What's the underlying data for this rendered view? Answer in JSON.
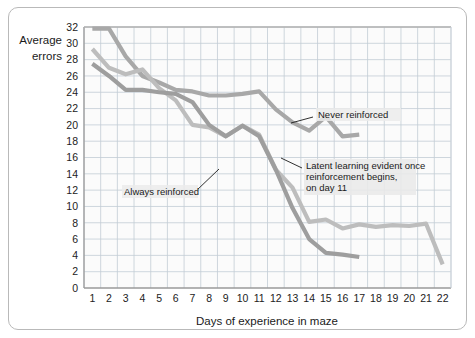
{
  "figure": {
    "border_color": "#b9b9b9",
    "background": "#ffffff"
  },
  "chart_data": {
    "type": "line",
    "title": "",
    "xlabel": "Days of experience in maze",
    "ylabel": "Average errors",
    "ylabel_line1": "Average",
    "ylabel_line2": "errors",
    "xlim": [
      1,
      22
    ],
    "ylim": [
      0,
      32
    ],
    "grid": true,
    "legend_position": "inline-annotations",
    "ytick_labels": [
      "0",
      "2",
      "4",
      "6",
      "8",
      "10",
      "12",
      "14",
      "16",
      "18",
      "20",
      "22",
      "24",
      "26",
      "28",
      "30",
      "32"
    ],
    "yticks": [
      0,
      2,
      4,
      6,
      8,
      10,
      12,
      14,
      16,
      18,
      20,
      22,
      24,
      26,
      28,
      30,
      32
    ],
    "xtick_labels": [
      "1",
      "2",
      "3",
      "4",
      "5",
      "6",
      "7",
      "8",
      "9",
      "10",
      "11",
      "12",
      "13",
      "14",
      "15",
      "16",
      "17",
      "18",
      "19",
      "20",
      "21",
      "22"
    ],
    "xticks": [
      1,
      2,
      3,
      4,
      5,
      6,
      7,
      8,
      9,
      10,
      11,
      12,
      13,
      14,
      15,
      16,
      17,
      18,
      19,
      20,
      21,
      22
    ],
    "grid_color": "#c3cdd6",
    "plot_bg": "#fbfbfb",
    "series": [
      {
        "name": "Never reinforced",
        "color": "#a8a8a8",
        "width": 4.2,
        "x": [
          1,
          2,
          3,
          4,
          5,
          6,
          7,
          8,
          9,
          10,
          11,
          12,
          13,
          14,
          15,
          16,
          17
        ],
        "values": [
          31.8,
          31.8,
          28.4,
          26.0,
          25.2,
          24.3,
          24.1,
          23.6,
          23.6,
          23.8,
          24.1,
          21.9,
          20.3,
          19.3,
          21.0,
          18.6,
          18.8
        ]
      },
      {
        "name": "Always reinforced",
        "color": "#bdbdbd",
        "width": 4.2,
        "x": [
          1,
          2,
          3,
          4,
          5,
          6,
          7,
          8,
          9,
          10,
          11,
          12,
          13,
          14,
          15,
          16,
          17,
          18,
          19,
          20,
          21,
          22
        ],
        "values": [
          29.3,
          27.0,
          26.2,
          26.8,
          24.5,
          23.0,
          20.0,
          19.7,
          18.6,
          19.9,
          18.8,
          14.5,
          12.3,
          8.1,
          8.4,
          7.3,
          7.8,
          7.5,
          7.7,
          7.6,
          7.9,
          2.9
        ]
      },
      {
        "name": "Latent learning (no reinforcement until day 11)",
        "color": "#9e9e9e",
        "width": 4.2,
        "x": [
          1,
          2,
          3,
          4,
          5,
          6,
          7,
          8,
          9,
          10,
          11,
          12,
          13,
          14,
          15,
          16,
          17
        ],
        "values": [
          27.5,
          26.0,
          24.3,
          24.3,
          24.0,
          23.8,
          22.8,
          20.0,
          18.6,
          19.9,
          18.6,
          14.5,
          9.8,
          6.0,
          4.3,
          4.1,
          3.8
        ]
      }
    ],
    "annotations": [
      {
        "id": "never-reinforced",
        "text": "Never reinforced",
        "lines": [
          "Never reinforced"
        ]
      },
      {
        "id": "always-reinforced",
        "text": "Always reinforced",
        "lines": [
          "Always reinforced"
        ]
      },
      {
        "id": "latent-learning",
        "text": "Latent learning evident once reinforcement begins, on day 11",
        "lines": [
          "Latent learning evident once",
          "reinforcement begins,",
          "on day 11"
        ]
      }
    ]
  }
}
